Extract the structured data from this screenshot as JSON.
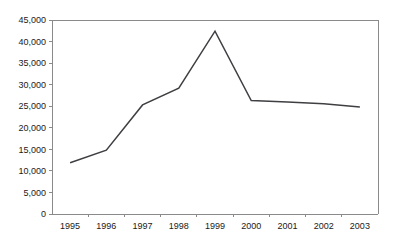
{
  "chart_data": {
    "type": "line",
    "title": "",
    "subtitle": "",
    "xlabel": "",
    "ylabel": "",
    "categories": [
      "1995",
      "1996",
      "1997",
      "1998",
      "1999",
      "2000",
      "2001",
      "2002",
      "2003"
    ],
    "values": [
      11900,
      14800,
      25300,
      29200,
      42400,
      26300,
      26000,
      25600,
      24800
    ],
    "series": [
      {
        "name": "",
        "color": "#3f3f43",
        "values": [
          11900,
          14800,
          25300,
          29200,
          42400,
          26300,
          26000,
          25600,
          24800
        ]
      }
    ],
    "ylim": [
      0,
      45000
    ],
    "ytick_values": [
      0,
      5000,
      10000,
      15000,
      20000,
      25000,
      30000,
      35000,
      40000,
      45000
    ],
    "ytick_labels": [
      "0",
      "5,000",
      "10,000",
      "15,000",
      "20,000",
      "25,000",
      "30,000",
      "35,000",
      "40,000",
      "45,000"
    ],
    "xtick_labels": [
      "1995",
      "1996",
      "1997",
      "1998",
      "1999",
      "2000",
      "2001",
      "2002",
      "2003"
    ],
    "grid": false,
    "legend": false,
    "legend_position": "none",
    "annotations": [],
    "axis_color": "#8a8a8a",
    "background_color": "#ffffff",
    "text_color": "#1a1a1a"
  },
  "plot": {
    "left": 52,
    "right": 378,
    "top": 20,
    "bottom": 214
  }
}
